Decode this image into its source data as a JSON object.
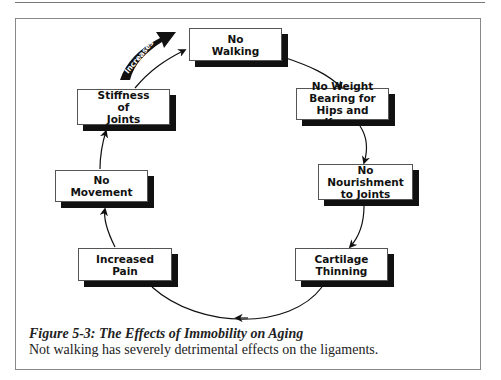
{
  "figure": {
    "nodes": [
      {
        "id": "no-walking",
        "label": "No\nWalking"
      },
      {
        "id": "no-weight-bearing",
        "label": "No Weight\nBearing for\nHips and Knees"
      },
      {
        "id": "no-nourishment",
        "label": "No\nNourishment\nto Joints"
      },
      {
        "id": "cartilage-thinning",
        "label": "Cartilage\nThinning"
      },
      {
        "id": "increased-pain",
        "label": "Increased\nPain"
      },
      {
        "id": "no-movement",
        "label": "No\nMovement"
      },
      {
        "id": "stiffness-of-joints",
        "label": "Stiffness\nof\nJoints"
      }
    ],
    "cycle_arrow_label": "Increases",
    "caption": {
      "title": "Figure 5-3:  The Effects of Immobility on Aging",
      "description": "Not walking has severely detrimental effects on the ligaments."
    },
    "colors": {
      "shadow": "#111111",
      "border": "#555555",
      "frame": "#888888"
    }
  }
}
